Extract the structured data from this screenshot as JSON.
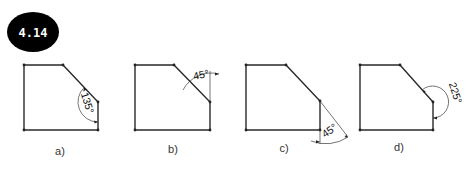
{
  "figure": {
    "number": "4.14",
    "badge_color": "#000000",
    "badge_text_color": "#ffffff",
    "panels": [
      {
        "id": "a",
        "label": "a)",
        "angle_label": "135°",
        "angle_degrees": 135,
        "description": "interior angle between chamfer and right side"
      },
      {
        "id": "b",
        "label": "b)",
        "angle_label": "45°",
        "angle_degrees": 45,
        "description": "angle between chamfer and upward extension of right side"
      },
      {
        "id": "c",
        "label": "c)",
        "angle_label": "45°",
        "angle_degrees": 45,
        "description": "angle between extended chamfer and downward extension of right side"
      },
      {
        "id": "d",
        "label": "d)",
        "angle_label": "225°",
        "angle_degrees": 225,
        "description": "exterior reflex angle at chamfer corner"
      }
    ]
  }
}
